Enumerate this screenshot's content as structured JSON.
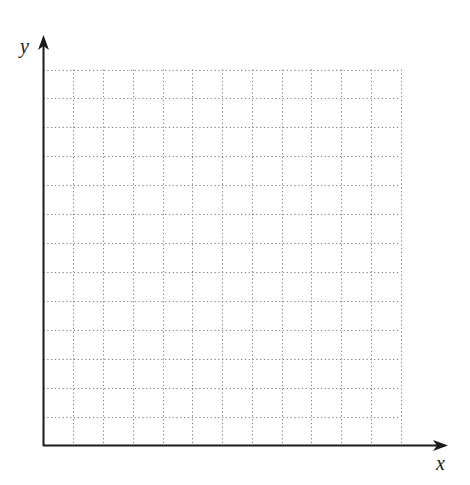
{
  "diagram": {
    "type": "blank-coordinate-grid",
    "x_axis_label": "x",
    "y_axis_label": "y",
    "grid": {
      "columns": 12,
      "rows": 13,
      "line_style": "dotted",
      "line_color": "#7a7a7a"
    },
    "axis_color": "#1a1a1a"
  }
}
